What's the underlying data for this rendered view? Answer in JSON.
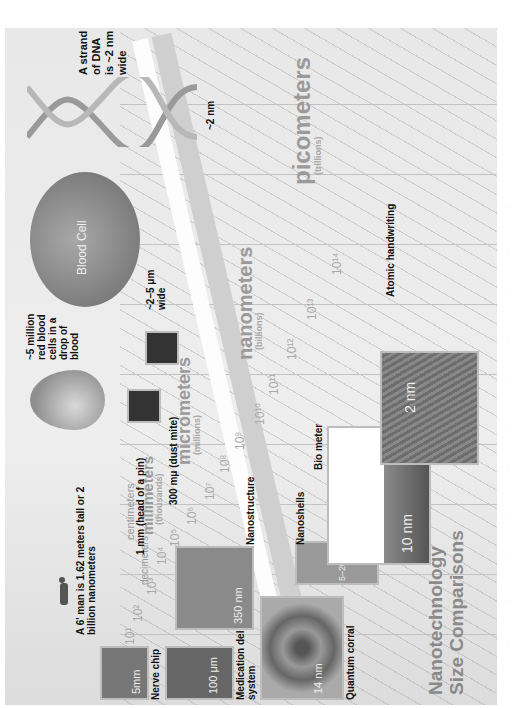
{
  "title": {
    "line1": "Nanotechnology",
    "line2": "Size Comparisons"
  },
  "scale_units": [
    {
      "name": "decimeters",
      "sub": ""
    },
    {
      "name": "centimeters",
      "sub": ""
    },
    {
      "name": "millimeters",
      "sub": "(thousands)"
    },
    {
      "name": "micrometers",
      "sub": "(millions)"
    },
    {
      "name": "nanometers",
      "sub": "(billions)"
    },
    {
      "name": "picometers",
      "sub": "(trillions)"
    }
  ],
  "exponents": [
    "10¹",
    "10²",
    "10³",
    "10⁴",
    "10⁵",
    "10⁶",
    "10⁷",
    "10⁸",
    "10⁹",
    "10¹⁰",
    "10¹¹",
    "10¹²",
    "10¹³",
    "10¹⁴"
  ],
  "callouts": {
    "man": "A 6' man is 1.62 meters tall or 2 billion nanometers",
    "blood_drop": "~5 million red blood cells in a drop of blood",
    "blood_cell": "Blood Cell",
    "blood_cell_width": "~2–5 μm wide",
    "pin": "1 mm (head of a pin)",
    "dust_mite": "300 mμ (dust mite)",
    "dna": "A strand of DNA is ~2 nm wide",
    "dna_width": "~2 nm"
  },
  "images": {
    "nerve_chip": {
      "label": "Nerve chip",
      "scale": "5mm"
    },
    "medication": {
      "label": "Medication delivery system",
      "scale": "100 μm"
    },
    "nanostructure": {
      "label": "Nanostructure",
      "scale": "350 nm"
    },
    "quantum_corral": {
      "label": "Quantum corral",
      "scale": "14 nm"
    },
    "nanoshells": {
      "label": "Nanoshells",
      "scale": "5–20 nm"
    },
    "bio_meter": {
      "label": "Bio meter",
      "scale": "10 nm"
    },
    "atomic_handwriting": {
      "label": "Atomic handwriting",
      "scale": "2 nm"
    }
  },
  "colors": {
    "panel": "#e6e6e6",
    "label_text": "#111111",
    "unit_text": "#9a9a9a",
    "title_text": "#8a8a8a",
    "blood": "#8a8a8a"
  }
}
